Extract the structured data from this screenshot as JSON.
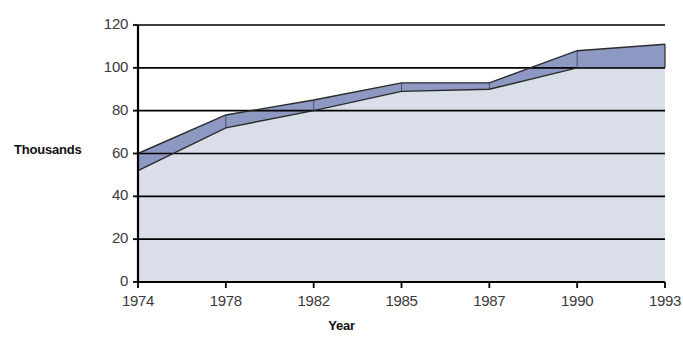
{
  "chart_data": {
    "type": "area",
    "title": "",
    "xlabel": "Year",
    "ylabel": "Thousands",
    "categories": [
      "1974",
      "1978",
      "1982",
      "1985",
      "1987",
      "1990",
      "1993"
    ],
    "series": [
      {
        "name": "lower-band",
        "values": [
          52,
          72,
          80,
          89,
          90,
          100,
          100
        ],
        "fill_color": "#d9dee8",
        "line_color": "#2b2b2b"
      },
      {
        "name": "upper-band",
        "values": [
          60,
          78,
          85,
          93,
          93,
          108,
          111
        ],
        "fill_color": "#8d99c2",
        "line_color": "#2b2b2b"
      }
    ],
    "ylim": [
      0,
      120
    ],
    "yticks": [
      "0",
      "20",
      "40",
      "60",
      "80",
      "100",
      "120"
    ],
    "ytick_values": [
      0,
      20,
      40,
      60,
      80,
      100,
      120
    ],
    "grid": true,
    "grid_color": "#000000",
    "legend": "none",
    "axis_color": "#000000",
    "plot_background": "#ffffff"
  },
  "labels": {
    "y_axis_title": "Thousands",
    "x_axis_title": "Year"
  }
}
